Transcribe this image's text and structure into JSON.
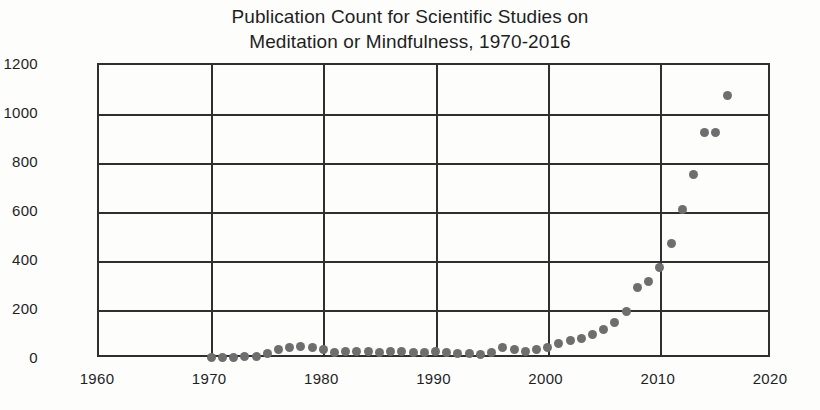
{
  "chart_data": {
    "type": "scatter",
    "title": "Publication Count for Scientific Studies on Meditation or Mindfulness, 1970-2016",
    "title_line1": "Publication Count for Scientific Studies on",
    "title_line2": "Meditation or Mindfulness, 1970-2016",
    "xlabel": "",
    "ylabel": "",
    "xlim": [
      1960,
      2020
    ],
    "ylim": [
      0,
      1200
    ],
    "xticks": [
      1960,
      1970,
      1980,
      1990,
      2000,
      2010,
      2020
    ],
    "yticks": [
      0,
      200,
      400,
      600,
      800,
      1000,
      1200
    ],
    "xtick_labels": [
      "1960",
      "1970",
      "1980",
      "1990",
      "2000",
      "2010",
      "2020"
    ],
    "ytick_labels": [
      "0",
      "200",
      "400",
      "600",
      "800",
      "1000",
      "1200"
    ],
    "grid": "horizontal gridlines at every y tick; vertical gridlines at 1970, 1980, 1990, 2000, 2010",
    "legend": null,
    "legend_position": "none",
    "marker_color": "#6e6e6e",
    "axis_color": "#2f2f2f",
    "background_color": "#fdfdfc",
    "series": [
      {
        "name": "Publications per year",
        "x": [
          1970,
          1971,
          1972,
          1973,
          1974,
          1975,
          1976,
          1977,
          1978,
          1979,
          1980,
          1981,
          1982,
          1983,
          1984,
          1985,
          1986,
          1987,
          1988,
          1989,
          1990,
          1991,
          1992,
          1993,
          1994,
          1995,
          1996,
          1997,
          1998,
          1999,
          2000,
          2001,
          2002,
          2003,
          2004,
          2005,
          2006,
          2007,
          2008,
          2009,
          2010,
          2011,
          2012,
          2013,
          2014,
          2015,
          2016
        ],
        "values": [
          5,
          6,
          8,
          10,
          12,
          22,
          40,
          48,
          52,
          45,
          40,
          28,
          30,
          32,
          30,
          28,
          32,
          30,
          28,
          26,
          30,
          26,
          24,
          22,
          20,
          28,
          45,
          38,
          32,
          40,
          48,
          62,
          75,
          82,
          98,
          120,
          150,
          195,
          290,
          315,
          375,
          470,
          610,
          755,
          925,
          925,
          1075
        ]
      }
    ]
  }
}
